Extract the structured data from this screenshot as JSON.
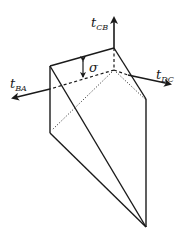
{
  "diagram": {
    "type": "3d wedge / prism stress diagram",
    "stroke_color": "#1a1a1a",
    "labels": {
      "t_cb": {
        "main": "t",
        "sub": "CB"
      },
      "t_dc": {
        "main": "t",
        "sub": "DC"
      },
      "t_ba": {
        "main": "t",
        "sub": "BA"
      },
      "sigma": "σ"
    }
  }
}
